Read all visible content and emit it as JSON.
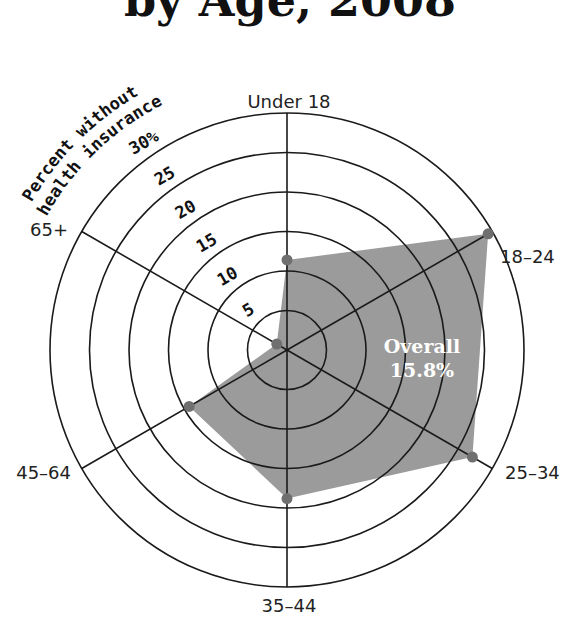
{
  "chart_data": {
    "type": "radar",
    "title": "by Age, 2008",
    "axis_title_lines": [
      "Percent without",
      "health insurance"
    ],
    "categories": [
      "Under 18",
      "18–24",
      "25–34",
      "35–44",
      "45–64",
      "65+"
    ],
    "series": [
      {
        "name": "Percent without health insurance",
        "values": [
          11.4,
          29.4,
          27.1,
          18.8,
          14.3,
          1.5
        ]
      }
    ],
    "rlim": [
      0,
      30
    ],
    "ticks": [
      5,
      10,
      15,
      20,
      25,
      30
    ],
    "tick_labels": [
      "5",
      "10",
      "15",
      "20",
      "25",
      "30%"
    ],
    "annotation": {
      "label": "Overall",
      "value": "15.8%"
    },
    "colors": {
      "fill": "#9b9b9b",
      "point": "#6f6f6f",
      "grid": "#1a1a1a"
    }
  }
}
